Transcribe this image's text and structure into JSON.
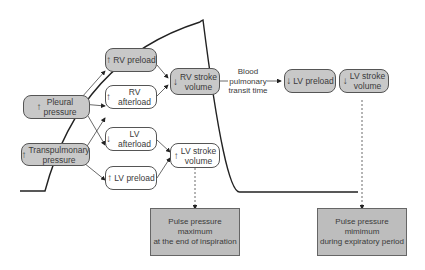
{
  "diagram": {
    "nodes": {
      "pleural_pressure": {
        "arrow": "↑",
        "label": "Pleural pressure",
        "line1": "Pleural",
        "line2": "pressure"
      },
      "transpulmonary_pressure": {
        "arrow": "↑",
        "label": "Transpulmonary pressure",
        "line1": "Transpulmonary",
        "line2": "pressure"
      },
      "rv_preload": {
        "arrow": "↑",
        "label": "RV preload"
      },
      "rv_afterload": {
        "arrow": "↑",
        "label": "RV afterload"
      },
      "lv_afterload": {
        "arrow": "↓",
        "label": "LV afterload"
      },
      "lv_preload_left": {
        "arrow": "↑",
        "label": "LV preload"
      },
      "rv_stroke_volume": {
        "arrow": "↓",
        "line1": "RV stroke",
        "line2": "volume"
      },
      "lv_stroke_volume_left": {
        "arrow": "↑",
        "line1": "LV stroke",
        "line2": "volume"
      },
      "lv_preload_right": {
        "arrow": "↓",
        "label": "LV preload"
      },
      "lv_stroke_volume_right": {
        "arrow": "↓",
        "line1": "LV stroke",
        "line2": "volume"
      }
    },
    "transit_label": {
      "line1": "Blood",
      "line2": "pulmonary",
      "line3": "transit time"
    },
    "outcomes": {
      "maximum": {
        "line1": "Pulse pressure maximum",
        "line2": "at the end of inspiration"
      },
      "minimum": {
        "line1": "Pulse pressure mimimum",
        "line2": "during expiratory period"
      }
    },
    "colors": {
      "gray_fill": "#c8c8c8",
      "outcome_fill": "#bdbdbd",
      "line": "#222222"
    }
  }
}
